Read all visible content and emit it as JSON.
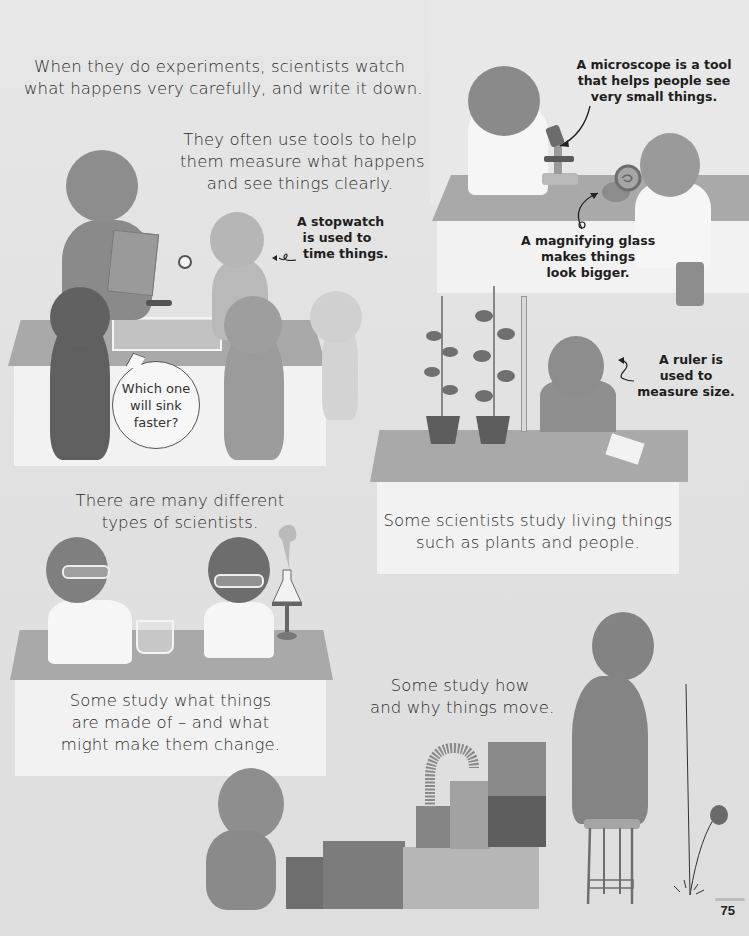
{
  "page": {
    "number": "75",
    "colors": {
      "background": "#e3e3e3",
      "desk_top": "#a9a9a9",
      "desk_front": "#f2f2f2",
      "text": "#2b2b2b"
    }
  },
  "narration": {
    "intro": {
      "lines": [
        "When they do experiments, scientists watch",
        "what happens very carefully, and write it down."
      ]
    },
    "tools": {
      "lines": [
        "They often use tools to help",
        "them measure what happens",
        "and see things clearly."
      ]
    },
    "types": {
      "lines": [
        "There are many different",
        "types of scientists."
      ]
    },
    "living_things": {
      "lines": [
        "Some scientists study living things",
        "such as plants and people."
      ]
    },
    "materials": {
      "lines": [
        "Some study what things",
        "are made of – and what",
        "might make them change."
      ]
    },
    "movement": {
      "lines": [
        "Some study how",
        "and why things move."
      ]
    }
  },
  "labels": {
    "microscope": {
      "lines": [
        "A microscope is a tool",
        "that helps people see",
        "very small things."
      ]
    },
    "magnifying_glass": {
      "lines": [
        "A magnifying glass",
        "makes things",
        "look bigger."
      ]
    },
    "stopwatch": {
      "lines": [
        "A stopwatch",
        "is used to",
        "time things."
      ]
    },
    "ruler": {
      "lines": [
        "A ruler is",
        "used to",
        "measure size."
      ]
    }
  },
  "speech_bubble": {
    "lines": [
      "Which one",
      "will sink",
      "faster?"
    ]
  },
  "illustrations": {
    "scene_observation": [
      "scientist-with-clipboard",
      "child-with-stopwatch",
      "child-with-key",
      "child-with-feather",
      "child-watching",
      "water-tank"
    ],
    "scene_microscope": [
      "scientist-at-microscope",
      "microscope",
      "scientist-with-magnifying-glass",
      "snail-shell"
    ],
    "scene_plants": [
      "plant-pot-short",
      "plant-pot-tall",
      "scientist-with-ruler",
      "notes-paper"
    ],
    "scene_chemistry": [
      "scientist-with-dropper",
      "beaker",
      "scientist-writing",
      "flask-on-burner"
    ],
    "scene_motion": [
      "crouching-child",
      "stacked-boxes",
      "slinky-spring",
      "child-on-stool",
      "bouncing-ball"
    ]
  }
}
